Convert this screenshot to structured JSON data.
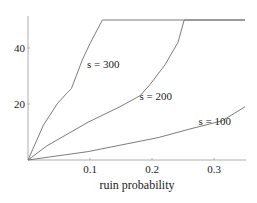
{
  "chart_data": {
    "type": "line",
    "title": "",
    "xlabel": "ruin probability",
    "ylabel": "",
    "xlim": [
      0,
      0.35
    ],
    "ylim": [
      0,
      51
    ],
    "grid": false,
    "legend": "inline curve labels",
    "x_ticks": [
      0.1,
      0.2,
      0.3
    ],
    "x_tick_labels": [
      "0.1",
      "0.2",
      "0.3"
    ],
    "y_ticks": [
      20,
      40
    ],
    "y_tick_labels": [
      "20",
      "40"
    ],
    "cap_value": 50,
    "series": [
      {
        "name": "s = 300",
        "label_pos": [
          0.095,
          33
        ],
        "points": [
          [
            0,
            0
          ],
          [
            0.025,
            12.5
          ],
          [
            0.047,
            20
          ],
          [
            0.063,
            24
          ],
          [
            0.07,
            25.5
          ],
          [
            0.088,
            36
          ],
          [
            0.101,
            42
          ],
          [
            0.12,
            50
          ],
          [
            0.35,
            50
          ]
        ]
      },
      {
        "name": "s = 200",
        "label_pos": [
          0.18,
          21.5
        ],
        "points": [
          [
            0,
            0
          ],
          [
            0.03,
            5
          ],
          [
            0.097,
            13.5
          ],
          [
            0.148,
            19
          ],
          [
            0.181,
            23
          ],
          [
            0.197,
            27
          ],
          [
            0.221,
            34
          ],
          [
            0.242,
            42
          ],
          [
            0.252,
            50
          ],
          [
            0.35,
            50
          ]
        ]
      },
      {
        "name": "s = 100",
        "label_pos": [
          0.275,
          12.5
        ],
        "points": [
          [
            0,
            0
          ],
          [
            0.097,
            3
          ],
          [
            0.21,
            8
          ],
          [
            0.26,
            11
          ],
          [
            0.313,
            14
          ],
          [
            0.35,
            19
          ]
        ]
      }
    ]
  }
}
